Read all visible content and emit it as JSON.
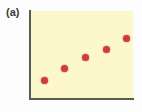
{
  "figure": {
    "panel_label": "(a)",
    "background_color": "#fdfdfd",
    "plot_background_color": "#fcf8cc",
    "axis_color": "#595c55",
    "point_color": "#cf3b43"
  },
  "chart_data": {
    "type": "scatter",
    "title": "(a)",
    "xlabel": "",
    "ylabel": "",
    "xlim": [
      0,
      100
    ],
    "ylim": [
      0,
      100
    ],
    "grid": false,
    "legend": "none",
    "series": [
      {
        "name": "series-1",
        "marker": "circle",
        "color": "#cf3b43",
        "x": [
          13,
          33,
          53,
          74,
          94
        ],
        "y": [
          21,
          35,
          47,
          56,
          69
        ],
        "points": [
          {
            "x": 13,
            "y": 21
          },
          {
            "x": 33,
            "y": 35
          },
          {
            "x": 53,
            "y": 47
          },
          {
            "x": 74,
            "y": 56
          },
          {
            "x": 94,
            "y": 69
          }
        ]
      }
    ],
    "tick_labels": {
      "x": [],
      "y": []
    },
    "annotations": []
  }
}
